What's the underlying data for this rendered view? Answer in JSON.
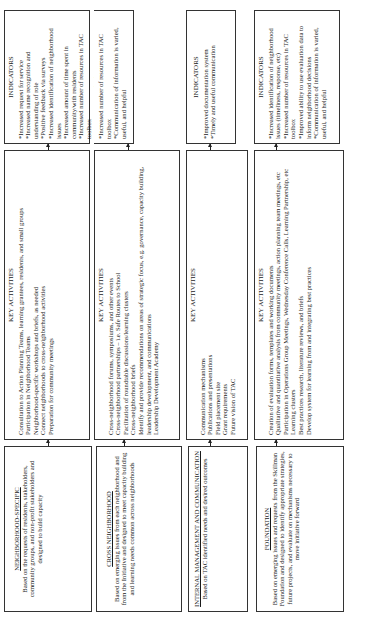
{
  "rows": [
    {
      "source": {
        "title": "NEIGHBORHOOD-SPECIFIC",
        "description": "Based on the requests of residents, stakeholders, community groups, and non-profit stakeholders and designed to build capacity"
      },
      "activities": {
        "heading": "KEY ACTIVITIES",
        "items": [
          "Consultation to Action Planning Teams, learning grantees, residents, and small groups",
          "Participation in Neighborhood Teams",
          "Neighborhood-specific workshops and briefs, as needed",
          "Connect neighborhoods to cross-neighborhood activities",
          "Preparation for community meetings"
        ]
      },
      "indicators": {
        "heading": "INDICATORS",
        "items": [
          "*Increased request for service",
          "*Increased name recognition and understanding of role",
          "*Positive feedback via surveys",
          "*Increased identification of neighborhood issues",
          "*Increased amount of time spent in community/with residents",
          "*Increased number of resources in TAC toolbox",
          "*Communication of information is varied, useful, and helpful"
        ]
      }
    },
    {
      "source": {
        "title": "CROSS NEIGHBORHOOD",
        "description": "Based on emerging issues from each neighborhood and from the Initiative and designed to meet capacity building and learning needs common across neighborhoods"
      },
      "activities": {
        "heading": "KEY ACTIVITIES",
        "items": [
          "Cross-neighborhood forums, symposiums, and other events",
          "Cross-neighborhood partnerships – i.e. Safe Routes to School",
          "Facilitation of roundtable discussions/learning clusters",
          "Cross-neighborhood briefs",
          "Identify and provide recommendations on areas of strategic focus, e.g. governance, capacity building, leadership development, and communications",
          "Leadership Development Academy"
        ]
      },
      "indicators": {
        "heading": "INDICATORS",
        "items": []
      }
    },
    {
      "source": {
        "title": "INTERNAL MANAGEMENT AND COMMUNICATION",
        "description": "Based on TAC identified needs and desired outcomes"
      },
      "activities": {
        "heading": "KEY ACTIVITIES",
        "items": [
          "Communication mechanisms",
          "Publications and presentations",
          "Field placement site",
          "Grant requirements",
          "Future vision of TAC"
        ]
      },
      "indicators": {
        "heading": "INDICATORS",
        "items": [
          "*Improved documentation system",
          "*Timely and useful communication"
        ]
      }
    },
    {
      "source": {
        "title": "FOUNDATION",
        "description": "Based on emerging issues and requests from the Skillman Foundation and designed to identify appropriate strategies, future projects, and evaluate on mechanisms necessary to move initiative forward"
      },
      "activities": {
        "heading": "KEY ACTIVITIES",
        "items": [
          "Creation of evaluation forms, templates and working documents",
          "Qualitative and quantitative analysis from community meetings, action planning team meetings, etc",
          "Participation in Operations Group Meetings, Wednesday Conference Calls, Learning Partnership, etc",
          "Learning clusters",
          "Best practices research, literature reviews, and briefs",
          "Develop system for learning from and integrating best practices"
        ]
      },
      "indicators": {
        "heading": "INDICATORS",
        "items": [
          "*Increased identification of neighborhood issues (timeliness, response, etc)",
          "*Increased number of resources in TAC toolbox",
          "*Improved ability to use evaluation data to inform neighborhood decisions",
          "*Communication of information is varied, useful, and helpful"
        ]
      }
    }
  ],
  "shared_indicators_row2": {
    "note": "Row 2 indicators box (cross neighborhood) content",
    "items": [
      "*Increased number of resources in TAC toolbox",
      "*Communication of information is varied, useful, and helpful"
    ]
  }
}
